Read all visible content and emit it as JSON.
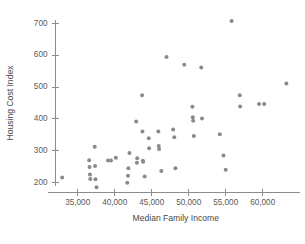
{
  "chart_data": {
    "type": "scatter",
    "title": "",
    "xlabel": "Median Family Income",
    "ylabel": "Housing Cost Index",
    "xlim": [
      32000,
      64500
    ],
    "ylim": [
      170,
      730
    ],
    "xticks": [
      35000,
      40000,
      45000,
      50000,
      55000,
      60000
    ],
    "xticklabels": [
      "35,000",
      "40,000",
      "45,000",
      "50,000",
      "55,000",
      "60,000"
    ],
    "yticks": [
      200,
      300,
      400,
      500,
      600,
      700
    ],
    "yticklabels": [
      "200",
      "300",
      "400",
      "500",
      "600",
      "700"
    ],
    "grid": false,
    "legend": false,
    "marker": {
      "shape": "circle",
      "color": "#8a8a8a",
      "size": 4
    },
    "points": [
      {
        "x": 32900,
        "y": 216
      },
      {
        "x": 36550,
        "y": 270
      },
      {
        "x": 36600,
        "y": 249
      },
      {
        "x": 36650,
        "y": 225
      },
      {
        "x": 36700,
        "y": 211
      },
      {
        "x": 37300,
        "y": 312
      },
      {
        "x": 37350,
        "y": 252
      },
      {
        "x": 37400,
        "y": 210
      },
      {
        "x": 37550,
        "y": 185
      },
      {
        "x": 39100,
        "y": 269
      },
      {
        "x": 39500,
        "y": 269
      },
      {
        "x": 40150,
        "y": 278
      },
      {
        "x": 41700,
        "y": 199
      },
      {
        "x": 41800,
        "y": 221
      },
      {
        "x": 41850,
        "y": 245
      },
      {
        "x": 42000,
        "y": 293
      },
      {
        "x": 42900,
        "y": 392
      },
      {
        "x": 43000,
        "y": 262
      },
      {
        "x": 43050,
        "y": 276
      },
      {
        "x": 43700,
        "y": 474
      },
      {
        "x": 43750,
        "y": 360
      },
      {
        "x": 43800,
        "y": 268
      },
      {
        "x": 43850,
        "y": 265
      },
      {
        "x": 44050,
        "y": 219
      },
      {
        "x": 44600,
        "y": 339
      },
      {
        "x": 44650,
        "y": 308
      },
      {
        "x": 45900,
        "y": 360
      },
      {
        "x": 45950,
        "y": 315
      },
      {
        "x": 46000,
        "y": 305
      },
      {
        "x": 46300,
        "y": 236
      },
      {
        "x": 47000,
        "y": 595
      },
      {
        "x": 47900,
        "y": 367
      },
      {
        "x": 48050,
        "y": 342
      },
      {
        "x": 48200,
        "y": 245
      },
      {
        "x": 49400,
        "y": 570
      },
      {
        "x": 50500,
        "y": 438
      },
      {
        "x": 50550,
        "y": 405
      },
      {
        "x": 50600,
        "y": 394
      },
      {
        "x": 50700,
        "y": 346
      },
      {
        "x": 51700,
        "y": 562
      },
      {
        "x": 51800,
        "y": 401
      },
      {
        "x": 54200,
        "y": 352
      },
      {
        "x": 54700,
        "y": 285
      },
      {
        "x": 55000,
        "y": 240
      },
      {
        "x": 55800,
        "y": 708
      },
      {
        "x": 56900,
        "y": 474
      },
      {
        "x": 56950,
        "y": 439
      },
      {
        "x": 59500,
        "y": 447
      },
      {
        "x": 60200,
        "y": 447
      },
      {
        "x": 63200,
        "y": 511
      }
    ]
  }
}
